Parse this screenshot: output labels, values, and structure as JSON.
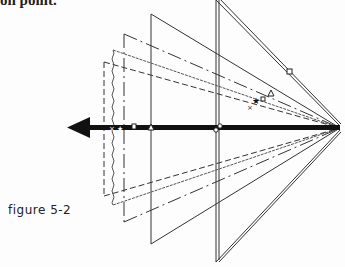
{
  "top_text": "on point.",
  "caption": "figure 5-2",
  "diagram": {
    "apex": [
      340,
      128
    ],
    "arrow_direction": "left",
    "frames": [
      {
        "style": "double",
        "x": 217,
        "top": 0,
        "bottom": 262
      },
      {
        "style": "solid",
        "x": 151,
        "top": 14,
        "bottom": 244
      },
      {
        "style": "dash-dot",
        "x": 124,
        "top": 34,
        "bottom": 222
      },
      {
        "style": "wavy",
        "x": 113,
        "top": 50,
        "bottom": 205
      },
      {
        "style": "dashed",
        "x": 104,
        "top": 62,
        "bottom": 196
      }
    ],
    "markers": [
      "square",
      "triangle",
      "square",
      "star",
      "x",
      "circle-pair"
    ]
  }
}
